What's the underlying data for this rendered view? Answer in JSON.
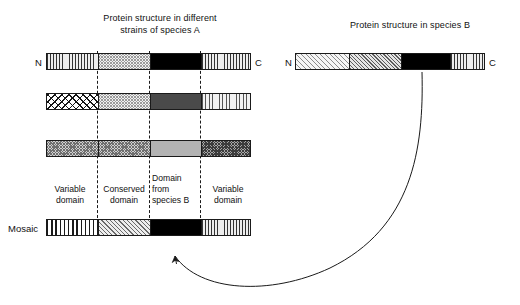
{
  "figure": {
    "panel_a_title": "Protein structure in different\nstrains of species A",
    "panel_b_title": "Protein structure in species B",
    "terminus_n": "N",
    "terminus_c": "C",
    "mosaic_label": "Mosaic",
    "colors": {
      "stroke": "#1a1a1a",
      "black_domain": "#000000",
      "dark_gray_domain": "#4a4a4a",
      "mid_gray_domain": "#b3b3b3",
      "background": "#ffffff"
    },
    "domain_labels": [
      {
        "id": "variable-left",
        "text": "Variable\ndomain"
      },
      {
        "id": "conserved",
        "text": "Conserved\ndomain"
      },
      {
        "id": "from-species-b",
        "text": "Domain\nfrom\nspecies B"
      },
      {
        "id": "variable-right",
        "text": "Variable\ndomain"
      }
    ],
    "species_a_bars": [
      {
        "id": "strain-1",
        "segments": [
          {
            "name": "variable-domain",
            "pattern": "vertical-stripe-fine"
          },
          {
            "name": "conserved-domain",
            "pattern": "dot-fine"
          },
          {
            "name": "species-b-domain",
            "pattern": "solid-black"
          },
          {
            "name": "variable-domain",
            "pattern": "vertical-stripe-fine"
          }
        ]
      },
      {
        "id": "strain-2",
        "segments": [
          {
            "name": "variable-domain",
            "pattern": "crosshatch-bold"
          },
          {
            "name": "conserved-domain",
            "pattern": "dot-fine"
          },
          {
            "name": "species-b-domain",
            "pattern": "solid-dark-gray"
          },
          {
            "name": "variable-domain",
            "pattern": "vertical-stripe-light"
          }
        ]
      },
      {
        "id": "strain-3",
        "segments": [
          {
            "name": "variable-domain",
            "pattern": "dot-mid"
          },
          {
            "name": "conserved-domain",
            "pattern": "dot-mid"
          },
          {
            "name": "species-b-domain",
            "pattern": "solid-mid-gray"
          },
          {
            "name": "variable-domain",
            "pattern": "dot-dark"
          }
        ]
      },
      {
        "id": "mosaic",
        "segments": [
          {
            "name": "variable-domain",
            "pattern": "vertical-stripe-bold"
          },
          {
            "name": "conserved-domain",
            "pattern": "diagonal-mid"
          },
          {
            "name": "species-b-domain",
            "pattern": "solid-black"
          },
          {
            "name": "variable-domain",
            "pattern": "vertical-stripe-fine"
          }
        ]
      }
    ],
    "species_b_bar": {
      "id": "species-b",
      "segments": [
        {
          "name": "segment-1",
          "pattern": "diagonal-light"
        },
        {
          "name": "segment-2",
          "pattern": "diagonal-dense"
        },
        {
          "name": "transferred-domain",
          "pattern": "solid-black"
        },
        {
          "name": "segment-4",
          "pattern": "vertical-stripe-fine"
        }
      ]
    },
    "annotation": {
      "arrow_name": "horizontal-gene-transfer-arrow",
      "meaning": "Domain transferred from species B into mosaic strain of species A"
    }
  }
}
